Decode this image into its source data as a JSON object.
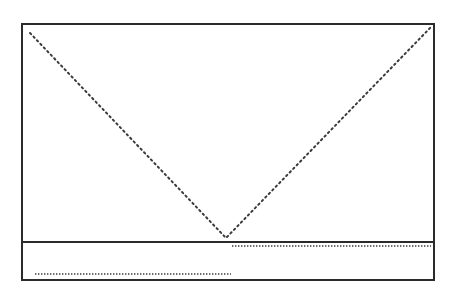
{
  "diagram": {
    "colors": {
      "background": "#ffffff",
      "frame": "#2b2b2b",
      "dots": "#3a3a3a"
    },
    "frame": {
      "x": 22,
      "y": 24,
      "width": 412,
      "height": 256
    },
    "divider_y": 242,
    "upper_panel": {
      "curve": "v-shape",
      "points": [
        {
          "x": 30,
          "y": 33
        },
        {
          "x": 226,
          "y": 238
        },
        {
          "x": 431,
          "y": 27
        }
      ]
    },
    "lower_panel": {
      "curve": "step",
      "segments": [
        {
          "x1": 35,
          "x2": 231,
          "y": 274
        },
        {
          "x1": 232,
          "x2": 431,
          "y": 246
        }
      ]
    }
  }
}
